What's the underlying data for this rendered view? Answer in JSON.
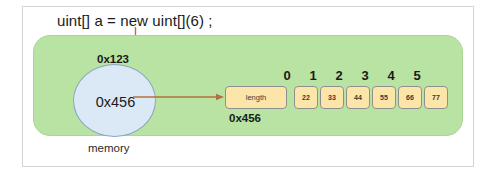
{
  "diagram": {
    "code_statement": "uint[] a = new uint[](6) ;",
    "memory_label": "memory",
    "pointer_address_label": "0x123",
    "circle_value": "0x456",
    "array_address_label": "0x456",
    "length_cell_label": "length",
    "indices": [
      "0",
      "1",
      "2",
      "3",
      "4",
      "5"
    ],
    "cell_values": [
      "22",
      "33",
      "44",
      "55",
      "66",
      "77"
    ],
    "colors": {
      "memory_panel": "#b9e3a2",
      "circle_fill": "#dbe9f6",
      "circle_stroke": "#8ba6bf",
      "cell_fill": "#fbe5a8",
      "cell_stroke": "#8f8f8f",
      "arrow": "#b5713a",
      "frame": "#d3d3d3"
    }
  }
}
